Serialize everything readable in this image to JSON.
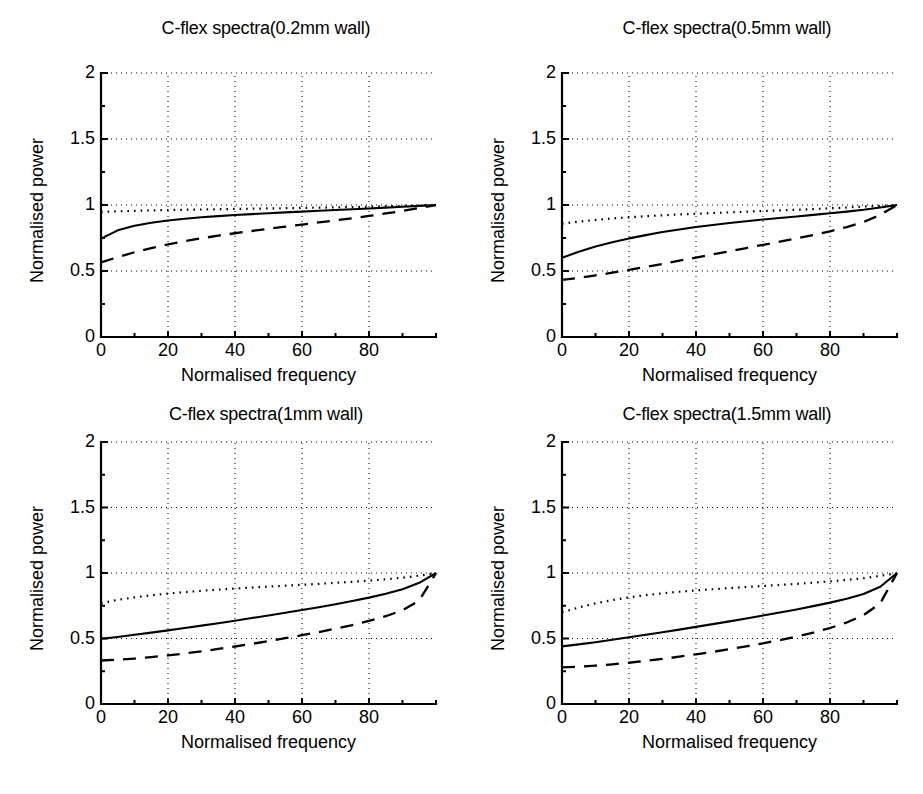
{
  "figure": {
    "background": "#ffffff",
    "ink": "#000000",
    "layout": "2x2 grid of line plots"
  },
  "chart_data": [
    {
      "type": "line",
      "title": "C-flex spectra(0.2mm wall)",
      "xlabel": "Normalised frequency",
      "ylabel": "Normalised power",
      "xlim": [
        0,
        100
      ],
      "ylim": [
        0,
        2
      ],
      "xticks": [
        0,
        20,
        40,
        60,
        80
      ],
      "xticklabels": [
        "0",
        "20",
        "40",
        "60",
        "80"
      ],
      "yticks": [
        0,
        0.5,
        1,
        1.5,
        2
      ],
      "yticklabels": [
        "0",
        "0.5",
        "1",
        "1.5",
        "2"
      ],
      "grid": true,
      "grid_style": "dotted",
      "legend": "none",
      "x": [
        0,
        5,
        10,
        15,
        20,
        25,
        30,
        35,
        40,
        45,
        50,
        55,
        60,
        65,
        70,
        75,
        80,
        85,
        90,
        95,
        100
      ],
      "series": [
        {
          "name": "solid",
          "style": "solid",
          "values": [
            0.745,
            0.808,
            0.843,
            0.866,
            0.883,
            0.896,
            0.907,
            0.916,
            0.924,
            0.931,
            0.938,
            0.944,
            0.95,
            0.956,
            0.962,
            0.968,
            0.974,
            0.98,
            0.987,
            0.993,
            1.0
          ]
        },
        {
          "name": "dashed",
          "style": "dashed",
          "values": [
            0.565,
            0.605,
            0.642,
            0.674,
            0.702,
            0.726,
            0.748,
            0.768,
            0.786,
            0.803,
            0.82,
            0.836,
            0.852,
            0.868,
            0.884,
            0.9,
            0.917,
            0.936,
            0.955,
            0.977,
            1.0
          ]
        },
        {
          "name": "dotted",
          "style": "dotted",
          "values": [
            0.947,
            0.952,
            0.956,
            0.959,
            0.962,
            0.964,
            0.966,
            0.968,
            0.97,
            0.972,
            0.974,
            0.976,
            0.978,
            0.98,
            0.982,
            0.984,
            0.987,
            0.99,
            0.993,
            0.996,
            1.0
          ]
        }
      ]
    },
    {
      "type": "line",
      "title": "C-flex spectra(0.5mm wall)",
      "xlabel": "Normalised frequency",
      "ylabel": "Normalised power",
      "xlim": [
        0,
        100
      ],
      "ylim": [
        0,
        2
      ],
      "xticks": [
        0,
        20,
        40,
        60,
        80
      ],
      "xticklabels": [
        "0",
        "20",
        "40",
        "60",
        "80"
      ],
      "yticks": [
        0,
        0.5,
        1,
        1.5,
        2
      ],
      "yticklabels": [
        "0",
        "0.5",
        "1",
        "1.5",
        "2"
      ],
      "grid": true,
      "grid_style": "dotted",
      "legend": "none",
      "x": [
        0,
        5,
        10,
        15,
        20,
        25,
        30,
        35,
        40,
        45,
        50,
        55,
        60,
        65,
        70,
        75,
        80,
        85,
        90,
        95,
        100
      ],
      "series": [
        {
          "name": "solid",
          "style": "solid",
          "values": [
            0.6,
            0.646,
            0.685,
            0.718,
            0.747,
            0.772,
            0.795,
            0.815,
            0.833,
            0.849,
            0.864,
            0.877,
            0.89,
            0.902,
            0.913,
            0.925,
            0.937,
            0.95,
            0.964,
            0.981,
            1.0
          ]
        },
        {
          "name": "dashed",
          "style": "dashed",
          "values": [
            0.432,
            0.448,
            0.467,
            0.487,
            0.508,
            0.531,
            0.554,
            0.578,
            0.602,
            0.626,
            0.65,
            0.674,
            0.698,
            0.722,
            0.747,
            0.773,
            0.801,
            0.833,
            0.871,
            0.925,
            1.0
          ]
        },
        {
          "name": "dotted",
          "style": "dotted",
          "values": [
            0.858,
            0.874,
            0.887,
            0.898,
            0.907,
            0.915,
            0.922,
            0.928,
            0.934,
            0.939,
            0.944,
            0.949,
            0.954,
            0.959,
            0.964,
            0.969,
            0.975,
            0.981,
            0.988,
            0.994,
            1.0
          ]
        }
      ]
    },
    {
      "type": "line",
      "title": "C-flex spectra(1mm wall)",
      "xlabel": "Normalised frequency",
      "ylabel": "Normalised power",
      "xlim": [
        0,
        100
      ],
      "ylim": [
        0,
        2
      ],
      "xticks": [
        0,
        20,
        40,
        60,
        80
      ],
      "xticklabels": [
        "0",
        "20",
        "40",
        "60",
        "80"
      ],
      "yticks": [
        0,
        0.5,
        1,
        1.5,
        2
      ],
      "yticklabels": [
        "0",
        "0.5",
        "1",
        "1.5",
        "2"
      ],
      "grid": true,
      "grid_style": "dotted",
      "legend": "none",
      "x": [
        0,
        5,
        10,
        15,
        20,
        25,
        30,
        35,
        40,
        45,
        50,
        55,
        60,
        65,
        70,
        75,
        80,
        85,
        90,
        95,
        100
      ],
      "series": [
        {
          "name": "solid",
          "style": "solid",
          "values": [
            0.498,
            0.512,
            0.528,
            0.545,
            0.562,
            0.58,
            0.598,
            0.617,
            0.636,
            0.656,
            0.676,
            0.696,
            0.717,
            0.739,
            0.762,
            0.786,
            0.812,
            0.841,
            0.876,
            0.925,
            1.0
          ]
        },
        {
          "name": "dashed",
          "style": "dashed",
          "values": [
            0.332,
            0.338,
            0.347,
            0.358,
            0.371,
            0.386,
            0.402,
            0.42,
            0.439,
            0.459,
            0.48,
            0.502,
            0.525,
            0.549,
            0.575,
            0.603,
            0.634,
            0.67,
            0.716,
            0.79,
            1.0
          ]
        },
        {
          "name": "dotted",
          "style": "dotted",
          "values": [
            0.77,
            0.795,
            0.814,
            0.83,
            0.843,
            0.854,
            0.864,
            0.873,
            0.881,
            0.889,
            0.896,
            0.903,
            0.91,
            0.917,
            0.925,
            0.933,
            0.942,
            0.952,
            0.964,
            0.98,
            1.0
          ]
        }
      ]
    },
    {
      "type": "line",
      "title": "C-flex spectra(1.5mm wall)",
      "xlabel": "Normalised frequency",
      "ylabel": "Normalised power",
      "xlim": [
        0,
        100
      ],
      "ylim": [
        0,
        2
      ],
      "xticks": [
        0,
        20,
        40,
        60,
        80
      ],
      "xticklabels": [
        "0",
        "20",
        "40",
        "60",
        "80"
      ],
      "yticks": [
        0,
        0.5,
        1,
        1.5,
        2
      ],
      "yticklabels": [
        "0",
        "0.5",
        "1",
        "1.5",
        "2"
      ],
      "grid": true,
      "grid_style": "dotted",
      "legend": "none",
      "x": [
        0,
        5,
        10,
        15,
        20,
        25,
        30,
        35,
        40,
        45,
        50,
        55,
        60,
        65,
        70,
        75,
        80,
        85,
        90,
        95,
        100
      ],
      "series": [
        {
          "name": "solid",
          "style": "solid",
          "values": [
            0.44,
            0.455,
            0.472,
            0.49,
            0.509,
            0.528,
            0.548,
            0.568,
            0.589,
            0.61,
            0.631,
            0.653,
            0.675,
            0.698,
            0.722,
            0.747,
            0.774,
            0.804,
            0.84,
            0.895,
            1.0
          ]
        },
        {
          "name": "dashed",
          "style": "dashed",
          "values": [
            0.28,
            0.285,
            0.293,
            0.303,
            0.315,
            0.329,
            0.344,
            0.361,
            0.379,
            0.398,
            0.418,
            0.44,
            0.463,
            0.488,
            0.515,
            0.545,
            0.58,
            0.622,
            0.678,
            0.768,
            1.0
          ]
        },
        {
          "name": "dotted",
          "style": "dotted",
          "values": [
            0.7,
            0.737,
            0.768,
            0.793,
            0.814,
            0.831,
            0.845,
            0.857,
            0.867,
            0.876,
            0.885,
            0.893,
            0.901,
            0.909,
            0.917,
            0.926,
            0.936,
            0.947,
            0.96,
            0.978,
            1.0
          ]
        }
      ]
    }
  ]
}
